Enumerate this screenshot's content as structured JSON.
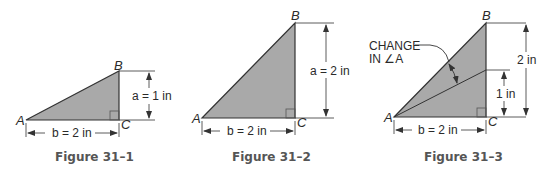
{
  "colors": {
    "fill": "#a9a9a9",
    "stroke": "#333333",
    "text": "#2a2a2a"
  },
  "figures": [
    {
      "caption": "Figure 31–1",
      "vertices": {
        "A": "A",
        "B": "B",
        "C": "C"
      },
      "side_b": "b = 2 in",
      "side_a": "a = 1 in"
    },
    {
      "caption": "Figure 31–2",
      "vertices": {
        "A": "A",
        "B": "B",
        "C": "C"
      },
      "side_b": "b = 2 in",
      "side_a": "a = 2 in"
    },
    {
      "caption": "Figure 31–3",
      "vertices": {
        "A": "A",
        "B": "B",
        "C": "C"
      },
      "side_b": "b = 2 in",
      "height_full": "2 in",
      "height_half": "1 in",
      "annotation_line1": "CHANGE",
      "annotation_line2": "IN ∠A"
    }
  ]
}
